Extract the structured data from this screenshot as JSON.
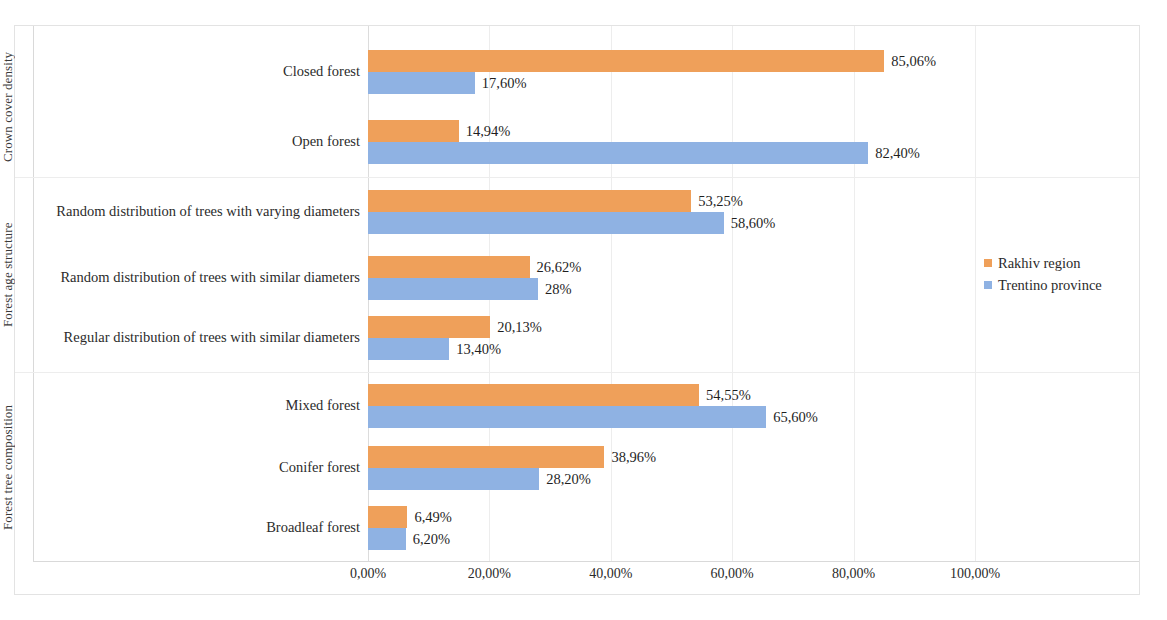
{
  "chart_data": {
    "type": "bar",
    "orientation": "horizontal",
    "title": "",
    "xlabel": "",
    "ylabel": "",
    "xlim": [
      0,
      100
    ],
    "xticks": [
      "0,00%",
      "20,00%",
      "40,00%",
      "60,00%",
      "80,00%",
      "100,00%"
    ],
    "xtick_values": [
      0,
      20,
      40,
      60,
      80,
      100
    ],
    "grid": true,
    "legend_position": "right",
    "series": [
      {
        "name": "Rakhiv region",
        "color": "#efa05a",
        "values": [
          85.06,
          14.94,
          53.25,
          26.62,
          20.13,
          54.55,
          38.96,
          6.49
        ],
        "labels": [
          "85,06%",
          "14,94%",
          "53,25%",
          "26,62%",
          "20,13%",
          "54,55%",
          "38,96%",
          "6,49%"
        ]
      },
      {
        "name": "Trentino province",
        "color": "#8fb2e3",
        "values": [
          17.6,
          82.4,
          58.6,
          28.0,
          13.4,
          65.6,
          28.2,
          6.2
        ],
        "labels": [
          "17,60%",
          "82,40%",
          "58,60%",
          "28%",
          "13,40%",
          "65,60%",
          "28,20%",
          "6,20%"
        ]
      }
    ],
    "categories": [
      "Closed forest",
      "Open forest",
      "Random distribution of trees with varying diameters",
      "Random distribution of trees with similar diameters",
      "Regular distribution of trees with similar diameters",
      "Mixed forest",
      "Conifer forest",
      "Broadleaf forest"
    ],
    "groups": [
      {
        "label": "Crown cover density",
        "categories": [
          "Closed forest",
          "Open forest"
        ]
      },
      {
        "label": "Forest age structure",
        "categories": [
          "Random distribution of trees with varying diameters",
          "Random distribution of trees with similar diameters",
          "Regular distribution of trees with similar diameters"
        ]
      },
      {
        "label": "Forest tree composition",
        "categories": [
          "Mixed forest",
          "Conifer forest",
          "Broadleaf forest"
        ]
      }
    ]
  },
  "legend": {
    "items": [
      {
        "label": "Rakhiv region"
      },
      {
        "label": "Trentino province"
      }
    ]
  }
}
